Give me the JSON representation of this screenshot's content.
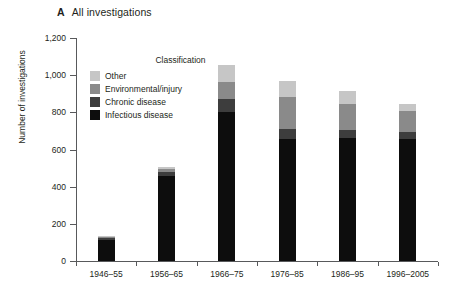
{
  "panel": {
    "letter": "A",
    "title": "All investigations"
  },
  "chart_data": {
    "type": "bar",
    "subtype": "stacked-bar",
    "title": "All investigations",
    "panel_letter": "A",
    "xlabel": "",
    "ylabel": "Number of investigations",
    "ylim": [
      0,
      1200
    ],
    "ytick_values": [
      0,
      200,
      400,
      600,
      800,
      1000,
      1200
    ],
    "ytick_labels": [
      "0",
      "200",
      "400",
      "600",
      "800",
      "1,000",
      "1,200"
    ],
    "grid": false,
    "legend_title": "Classification",
    "legend_position": "upper-left-inside",
    "categories": [
      "1946–55",
      "1956–65",
      "1966–75",
      "1976–85",
      "1986–95",
      "1996–2005"
    ],
    "series": [
      {
        "name": "Infectious disease",
        "color": "#0d0d0d",
        "values": [
          115,
          460,
          800,
          655,
          660,
          655
        ]
      },
      {
        "name": "Chronic disease",
        "color": "#3d3d3d",
        "values": [
          10,
          20,
          70,
          55,
          45,
          40
        ]
      },
      {
        "name": "Environmental/injury",
        "color": "#8a8a8a",
        "values": [
          5,
          15,
          95,
          175,
          140,
          110
        ]
      },
      {
        "name": "Other",
        "color": "#c6c6c6",
        "values": [
          5,
          10,
          90,
          85,
          70,
          40
        ]
      }
    ],
    "totals": [
      135,
      505,
      1055,
      970,
      915,
      845
    ]
  },
  "legend": {
    "title": "Classification",
    "items": [
      {
        "label": "Other",
        "color": "#c6c6c6"
      },
      {
        "label": "Environmental/injury",
        "color": "#8a8a8a"
      },
      {
        "label": "Chronic disease",
        "color": "#3d3d3d"
      },
      {
        "label": "Infectious disease",
        "color": "#0d0d0d"
      }
    ]
  },
  "axes": {
    "y_title": "Number of investigations",
    "y_ticks": [
      "1,200",
      "1,000",
      "800",
      "600",
      "400",
      "200",
      "0"
    ],
    "x_ticks": [
      "1946–55",
      "1956–65",
      "1966–75",
      "1976–85",
      "1986–95",
      "1996–2005"
    ]
  },
  "colors": {
    "axis": "#58595b",
    "text": "#231f20",
    "background": "#ffffff"
  }
}
